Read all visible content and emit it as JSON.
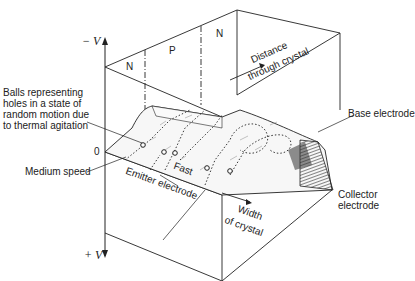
{
  "figure": {
    "axes": {
      "top_label": "− V",
      "bottom_label": "+ V",
      "zero_label": "0"
    },
    "regions": [
      {
        "label": "N"
      },
      {
        "label": "P"
      },
      {
        "label": "N"
      }
    ],
    "annotations": {
      "distance_line1": "Distance",
      "distance_line2": "through crystal",
      "balls_line1": "Balls representing",
      "balls_line2": "holes in a state of",
      "balls_line3": "random motion due",
      "balls_line4": "to thermal agitation",
      "base_electrode": "Base electrode",
      "medium_speed": "Medium speed",
      "fast": "Fast",
      "emitter_electrode": "Emitter electrode",
      "width_line1": "Width",
      "width_line2": "of crystal",
      "collector_line1": "Collector",
      "collector_line2": "electrode"
    },
    "colors": {
      "line": "#222222",
      "surface_shade": "#555555",
      "background": "#ffffff"
    }
  }
}
